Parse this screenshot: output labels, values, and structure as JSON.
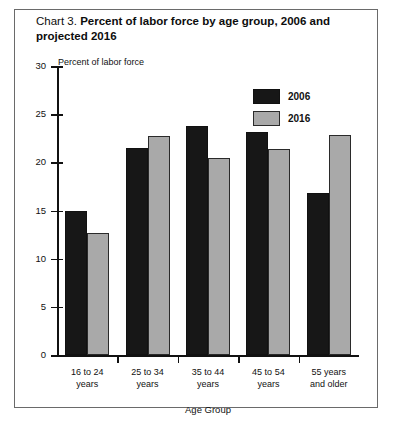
{
  "chart_data": {
    "type": "bar",
    "title_lead": "Chart 3.",
    "title": "Chart 3. Percent of labor force by age group, 2006 and projected 2016",
    "title_main": "Percent of labor force by age group, 2006 and projected 2016",
    "xlabel": "Age Group",
    "ylabel": "Percent of labor force",
    "ylim": [
      0,
      30
    ],
    "yticks": [
      30,
      25,
      20,
      15,
      10,
      5,
      0
    ],
    "grid": false,
    "legend_position": "upper-right",
    "categories": [
      "16 to 24\nyears",
      "25 to 34\nyears",
      "35 to 44\nyears",
      "45 to 54\nyears",
      "55 years\nand older"
    ],
    "series": [
      {
        "name": "2006",
        "color": "#171717",
        "values": [
          14.9,
          21.5,
          23.8,
          23.2,
          16.8
        ]
      },
      {
        "name": "2016",
        "color": "#a9a9a9",
        "values": [
          12.7,
          22.7,
          20.5,
          21.4,
          22.8
        ]
      }
    ]
  }
}
